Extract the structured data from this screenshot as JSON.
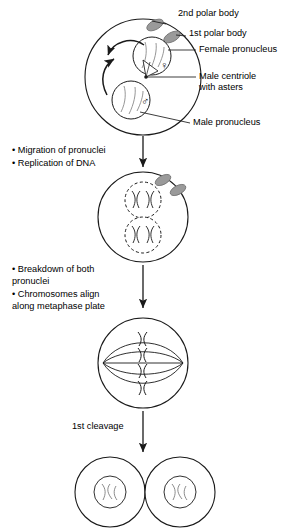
{
  "diagram": {
    "stroke_color": "#1a1a1a",
    "polar_body_color": "#9a9a9a",
    "background": "#ffffff"
  },
  "labels": {
    "second_polar_body": "2nd polar body",
    "first_polar_body": "1st polar body",
    "female_pronucleus": "Female pronucleus",
    "male_centriole_line1": "Male centriole",
    "male_centriole_line2": "with asters",
    "male_pronucleus": "Male pronucleus",
    "first_cleavage": "1st cleavage"
  },
  "symbols": {
    "female": "♀",
    "male": "♂"
  },
  "steps": [
    {
      "id": "step-1",
      "bullets": [
        "• Migration of pronuclei",
        "• Replication of DNA"
      ]
    },
    {
      "id": "step-2",
      "bullets": [
        "• Breakdown of both",
        "   pronuclei",
        "• Chromosomes align",
        "   along metaphase plate"
      ]
    }
  ],
  "stages": [
    {
      "name": "zygote-pronuclei",
      "description": "Zygote with female and male pronuclei and polar bodies"
    },
    {
      "name": "zygote-replicated-dna",
      "description": "Zygote with two dashed pronuclei containing replicated chromosomes"
    },
    {
      "name": "zygote-metaphase",
      "description": "Zygote at metaphase with mitotic spindle and aligned chromosomes"
    },
    {
      "name": "two-cell-embryo",
      "description": "Two-cell embryo after first cleavage"
    }
  ]
}
